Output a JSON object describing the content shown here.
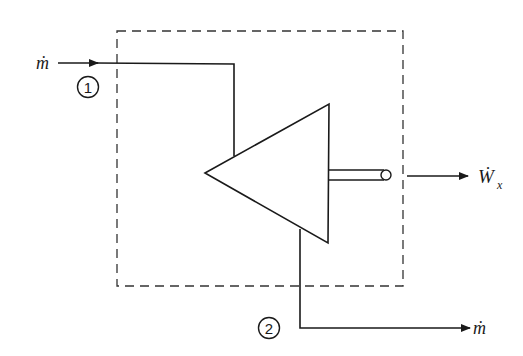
{
  "diagram": {
    "type": "control-volume turbine schematic",
    "control_volume": {
      "style": "dashed",
      "color": "#333333"
    },
    "component": {
      "name": "turbine",
      "shape": "triangle"
    },
    "inlet": {
      "state_label": "1",
      "flow_label": "ṁ"
    },
    "outlet": {
      "state_label": "2",
      "flow_label": "ṁ"
    },
    "work_output": {
      "label": "Ẇ",
      "subscript": "x"
    },
    "colors": {
      "line": "#1a1a1a",
      "background": "#ffffff"
    }
  }
}
